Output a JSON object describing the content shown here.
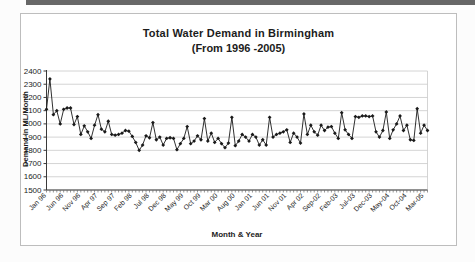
{
  "page": {
    "scan_bar_color": "#4b4b4b",
    "frame_border_color": "#bdbdbd",
    "background": "#ffffff"
  },
  "chart_data": {
    "type": "line",
    "title": "Total Water Demand in Birmingham",
    "subtitle": "(From 1996 -2005)",
    "xlabel": "Month & Year",
    "ylabel": "Demand in ML/Month",
    "ylim": [
      1500,
      2400
    ],
    "yticks": [
      1500,
      1600,
      1700,
      1800,
      1900,
      2000,
      2100,
      2200,
      2300,
      2400
    ],
    "grid": true,
    "legend": "none",
    "line_color": "#1a1a1a",
    "marker": "diamond",
    "marker_color": "#1a1a1a",
    "gridline_color": "#c9c9c9",
    "axis_color": "#3a3a3a",
    "n_points": 112,
    "x_start": "Jan 96",
    "x_end": "Apr 05",
    "x_tick_every": 5,
    "x_tick_labels": [
      "Jan 96",
      "Jun 96",
      "Nov 96",
      "Apr 97",
      "Sep 97",
      "Feb 98",
      "Jul 98",
      "Dec 98",
      "May 99",
      "Oct 99",
      "Mar 00",
      "Aug 00",
      "Jan 01",
      "Jun 01",
      "Nov 01",
      "Apr 02",
      "Sep-02",
      "Feb-03",
      "Jul-03",
      "Dec-03",
      "May-04",
      "Oct-04",
      "Mar-05"
    ],
    "values": [
      2110,
      2340,
      2070,
      2100,
      2000,
      2110,
      2120,
      2120,
      1995,
      2055,
      1920,
      1985,
      1940,
      1890,
      1990,
      2070,
      1960,
      1940,
      2020,
      1920,
      1915,
      1920,
      1930,
      1950,
      1945,
      1905,
      1860,
      1800,
      1840,
      1910,
      1895,
      2010,
      1880,
      1900,
      1840,
      1890,
      1895,
      1890,
      1805,
      1850,
      1890,
      1980,
      1850,
      1870,
      1910,
      1880,
      2040,
      1870,
      1930,
      1860,
      1890,
      1850,
      1820,
      1855,
      2050,
      1835,
      1870,
      1920,
      1900,
      1870,
      1920,
      1900,
      1840,
      1880,
      1840,
      2050,
      1900,
      1920,
      1930,
      1940,
      1955,
      1860,
      1930,
      1900,
      1855,
      2075,
      1920,
      1990,
      1940,
      1915,
      1990,
      1950,
      1975,
      1980,
      1930,
      1890,
      2085,
      1955,
      1920,
      1890,
      2055,
      2050,
      2060,
      2060,
      2055,
      2060,
      1940,
      1900,
      1950,
      2090,
      1890,
      1955,
      2000,
      2060,
      1950,
      1990,
      1880,
      1875,
      2115,
      1930,
      1990,
      1950
    ]
  }
}
